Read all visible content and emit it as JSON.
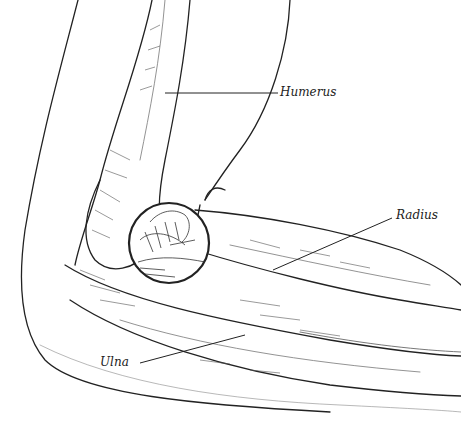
{
  "figure": {
    "labels": [
      {
        "id": "humerus",
        "text": "Humerus"
      },
      {
        "id": "radius",
        "text": "Radius"
      },
      {
        "id": "ulna",
        "text": "Ulna"
      }
    ],
    "colors": {
      "ink": "#222222",
      "background": "#ffffff",
      "shade": "#555555"
    }
  }
}
